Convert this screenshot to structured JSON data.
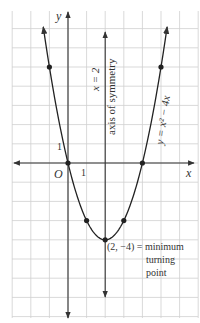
{
  "chart_data": {
    "type": "line",
    "title": "",
    "xlabel": "x",
    "ylabel": "y",
    "origin_label": "O",
    "x_tick_label": "1",
    "y_tick_label": "1",
    "xlim": [
      -3.6,
      7.0
    ],
    "ylim": [
      -8.2,
      8.4
    ],
    "grid": true,
    "series": [
      {
        "name": "y = x² − 4x",
        "equation_label": "y = x² − 4x",
        "x": [
          -1,
          0,
          1,
          2,
          3,
          4,
          5
        ],
        "y": [
          5,
          0,
          -3,
          -4,
          -3,
          0,
          5
        ],
        "marked_points": [
          [
            -1,
            5
          ],
          [
            0,
            0
          ],
          [
            1,
            -3
          ],
          [
            2,
            -4
          ],
          [
            3,
            -3
          ],
          [
            4,
            0
          ],
          [
            5,
            5
          ]
        ]
      }
    ],
    "annotations": {
      "axis_line_label": "x = 2",
      "axis_text": "axis of symmetry",
      "vertex_label_line1": "(2, −4) = minimum",
      "vertex_label_line2": "turning",
      "vertex_label_line3": "point"
    }
  },
  "colors": {
    "grid": "#cfcfcf",
    "axes": "#333333",
    "curve": "#222222",
    "text": "#444444"
  }
}
